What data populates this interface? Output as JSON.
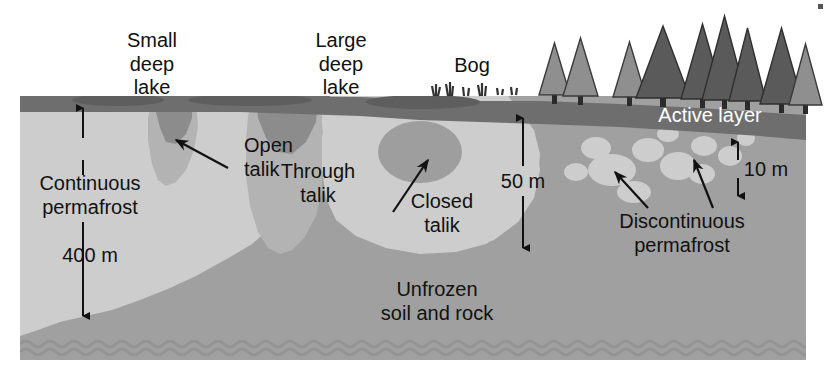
{
  "diagram": {
    "type": "cross-section-diagram",
    "background_color": "#ffffff",
    "colors": {
      "permafrost": "#cdcdcd",
      "unfrozen_soil": "#a0a0a0",
      "active_layer": "#6e6e6e",
      "lake_water": "#5e5e5e",
      "talik": "#b3b3b3",
      "tree_dark": "#5a5a5a",
      "tree_light": "#8f8f8f",
      "ink": "#111111",
      "white_text": "#ffffff"
    }
  },
  "labels": {
    "small_deep_lake": [
      "Small",
      "deep",
      "lake"
    ],
    "large_deep_lake": [
      "Large",
      "deep",
      "lake"
    ],
    "bog": "Bog",
    "active_layer": "Active layer",
    "open_talik": [
      "Open",
      "talik"
    ],
    "through_talik": [
      "Through",
      "talik"
    ],
    "closed_talik": [
      "Closed",
      "talik"
    ],
    "continuous_permafrost": [
      "Continuous",
      "permafrost"
    ],
    "discontinuous_permafrost": [
      "Discontinuous",
      "permafrost"
    ],
    "unfrozen": [
      "Unfrozen",
      "soil and rock"
    ]
  },
  "measurements": {
    "continuous_depth": "400 m",
    "mid_depth": "50 m",
    "active_layer_depth": "10 m"
  },
  "features": {
    "lakes": [
      {
        "name": "small-deep-lake",
        "cx": 118,
        "cy": 99,
        "rx": 44,
        "ry": 6
      },
      {
        "name": "large-deep-lake",
        "cx": 250,
        "cy": 99,
        "rx": 60,
        "ry": 6
      },
      {
        "name": "bog-pond",
        "cx": 420,
        "cy": 101,
        "rx": 55,
        "ry": 7
      }
    ],
    "trees": [
      {
        "x": 550,
        "size": 0.72,
        "tone": "light"
      },
      {
        "x": 575,
        "size": 0.8,
        "tone": "light"
      },
      {
        "x": 625,
        "size": 0.8,
        "tone": "light"
      },
      {
        "x": 658,
        "size": 1.05,
        "tone": "dark"
      },
      {
        "x": 700,
        "size": 1.1,
        "tone": "dark"
      },
      {
        "x": 722,
        "size": 1.25,
        "tone": "dark"
      },
      {
        "x": 745,
        "size": 1.0,
        "tone": "dark"
      },
      {
        "x": 778,
        "size": 1.0,
        "tone": "dark"
      },
      {
        "x": 800,
        "size": 0.8,
        "tone": "light"
      }
    ],
    "discontinuous_patches": [
      {
        "cx": 612,
        "cy": 168,
        "rx": 22,
        "ry": 15
      },
      {
        "cx": 648,
        "cy": 148,
        "rx": 14,
        "ry": 11
      },
      {
        "cx": 676,
        "cy": 162,
        "rx": 17,
        "ry": 14
      },
      {
        "cx": 703,
        "cy": 145,
        "rx": 12,
        "ry": 10
      },
      {
        "cx": 700,
        "cy": 172,
        "rx": 13,
        "ry": 10
      },
      {
        "cx": 728,
        "cy": 157,
        "rx": 11,
        "ry": 9
      },
      {
        "cx": 742,
        "cy": 139,
        "rx": 9,
        "ry": 8
      },
      {
        "cx": 630,
        "cy": 190,
        "rx": 16,
        "ry": 11
      },
      {
        "cx": 668,
        "cy": 134,
        "rx": 10,
        "ry": 7
      }
    ]
  }
}
